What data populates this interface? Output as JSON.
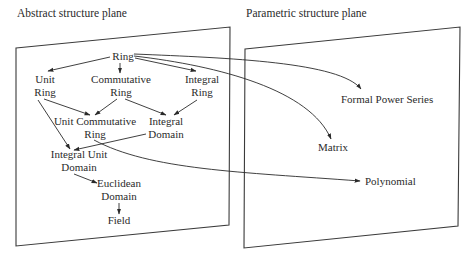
{
  "planes": {
    "abstract": {
      "title": "Abstract structure plane"
    },
    "parametric": {
      "title": "Parametric structure plane"
    }
  },
  "nodes": {
    "ring": [
      "Ring"
    ],
    "unit_ring": [
      "Unit",
      "Ring"
    ],
    "commutative_ring": [
      "Commutative",
      "Ring"
    ],
    "integral_ring": [
      "Integral",
      "Ring"
    ],
    "unit_commutative_ring": [
      "Unit Commutative",
      "Ring"
    ],
    "integral_domain": [
      "Integral",
      "Domain"
    ],
    "integral_unit_domain": [
      "Integral Unit",
      "Domain"
    ],
    "euclidean_domain": [
      "Euclidean",
      "Domain"
    ],
    "field": [
      "Field"
    ],
    "formal_power_series": [
      "Formal Power Series"
    ],
    "matrix": [
      "Matrix"
    ],
    "polynomial": [
      "Polynomial"
    ]
  },
  "edges": [
    {
      "from": "Ring",
      "to": "Unit Ring"
    },
    {
      "from": "Ring",
      "to": "Commutative Ring"
    },
    {
      "from": "Ring",
      "to": "Integral Ring"
    },
    {
      "from": "Unit Ring",
      "to": "Unit Commutative Ring"
    },
    {
      "from": "Commutative Ring",
      "to": "Unit Commutative Ring"
    },
    {
      "from": "Commutative Ring",
      "to": "Integral Domain"
    },
    {
      "from": "Integral Ring",
      "to": "Integral Domain"
    },
    {
      "from": "Unit Ring",
      "to": "Integral Unit Domain"
    },
    {
      "from": "Integral Domain",
      "to": "Integral Unit Domain"
    },
    {
      "from": "Integral Unit Domain",
      "to": "Euclidean Domain"
    },
    {
      "from": "Euclidean Domain",
      "to": "Field"
    },
    {
      "from": "Ring",
      "to": "Formal Power Series"
    },
    {
      "from": "Ring",
      "to": "Matrix"
    },
    {
      "from": "Unit Commutative Ring",
      "to": "Polynomial"
    }
  ]
}
